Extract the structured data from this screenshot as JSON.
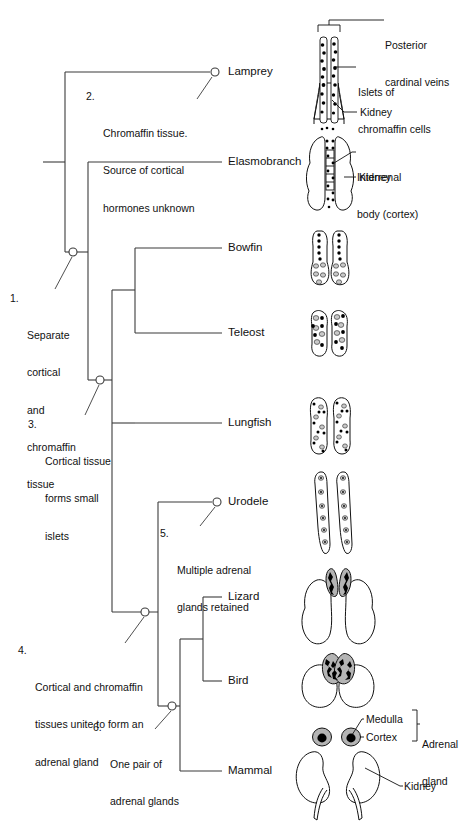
{
  "figure": {
    "kind": "cladogram",
    "line_color": "#3b3b3b",
    "ink_color": "#111111",
    "fill_white": "#ffffff",
    "fill_gray": "#b4b4b4",
    "fill_black": "#000000"
  },
  "taxa": [
    {
      "id": "lamprey",
      "label": "Lamprey",
      "x": 228,
      "y": 72,
      "node": true
    },
    {
      "id": "elasmobranch",
      "label": "Elasmobranch",
      "x": 228,
      "y": 162,
      "node": false
    },
    {
      "id": "bowfin",
      "label": "Bowfin",
      "x": 228,
      "y": 248,
      "node": false
    },
    {
      "id": "teleost",
      "label": "Teleost",
      "x": 228,
      "y": 333,
      "node": false
    },
    {
      "id": "lungfish",
      "label": "Lungfish",
      "x": 228,
      "y": 423,
      "node": false
    },
    {
      "id": "urodele",
      "label": "Urodele",
      "x": 228,
      "y": 502,
      "node": true
    },
    {
      "id": "lizard",
      "label": "Lizard",
      "x": 228,
      "y": 597,
      "node": false
    },
    {
      "id": "bird",
      "label": "Bird",
      "x": 228,
      "y": 681,
      "node": false
    },
    {
      "id": "mammal",
      "label": "Mammal",
      "x": 228,
      "y": 771,
      "node": false
    }
  ],
  "notes": [
    {
      "id": "note-2",
      "num": "2.",
      "lines": [
        "Chromaffin tissue.",
        "Source of cortical",
        "hormones unknown"
      ],
      "text": "2. Chromaffin tissue. Source of cortical hormones unknown",
      "x": 86,
      "y": 90,
      "leader": {
        "x1": 212,
        "y1": 78,
        "x2": 196,
        "y2": 100
      }
    },
    {
      "id": "note-1",
      "num": "1.",
      "lines": [
        "Separate",
        "cortical",
        "and",
        "chromaffin",
        "tissue"
      ],
      "text": "1. Separate cortical and chromaffin tissue",
      "x": 10,
      "y": 292,
      "leader": {
        "x1": 72,
        "y1": 258,
        "x2": 54,
        "y2": 288
      }
    },
    {
      "id": "note-3",
      "num": "3.",
      "lines": [
        "Cortical tissue",
        "forms small",
        "islets"
      ],
      "text": "3. Cortical tissue forms small islets",
      "x": 28,
      "y": 418,
      "leader": {
        "x1": 99,
        "y1": 386,
        "x2": 84,
        "y2": 414
      }
    },
    {
      "id": "note-5",
      "num": "5.",
      "lines": [
        "Multiple adrenal",
        "glands retained"
      ],
      "text": "5. Multiple adrenal glands retained",
      "x": 160,
      "y": 527,
      "leader": {
        "x1": 215,
        "y1": 508,
        "x2": 199,
        "y2": 525
      }
    },
    {
      "id": "note-4",
      "num": "4.",
      "lines": [
        "Cortical and chromaffin",
        "tissues unite to form an",
        "adrenal gland"
      ],
      "text": "4. Cortical and chromaffin tissues unite to form an adrenal gland",
      "x": 18,
      "y": 644,
      "leader": {
        "x1": 144,
        "y1": 618,
        "x2": 124,
        "y2": 642
      }
    },
    {
      "id": "note-6",
      "num": "6.",
      "lines": [
        "One pair of",
        "adrenal glands"
      ],
      "text": "6. One pair of adrenal glands",
      "x": 93,
      "y": 721,
      "leader": {
        "x1": 171,
        "y1": 712,
        "x2": 154,
        "y2": 728
      }
    }
  ],
  "annotations": [
    {
      "id": "anno-posterior-cardinal-veins",
      "lines": [
        "Posterior",
        "cardinal veins"
      ],
      "text": "Posterior cardinal veins",
      "x": 385,
      "y": 14
    },
    {
      "id": "anno-islets-chromaffin",
      "lines": [
        "Islets of",
        "chromaffin cells"
      ],
      "text": "Islets of chromaffin cells",
      "x": 358,
      "y": 64
    },
    {
      "id": "anno-kidney-lamprey",
      "lines": [
        "Kidney"
      ],
      "text": "Kidney",
      "x": 358,
      "y": 104
    },
    {
      "id": "anno-interrenal-body",
      "lines": [
        "Interrenal",
        "body (cortex)"
      ],
      "text": "Interrenal body (cortex)",
      "x": 357,
      "y": 146
    },
    {
      "id": "anno-kidney-elasmobranch",
      "lines": [
        "Kidney"
      ],
      "text": "Kidney",
      "x": 357,
      "y": 180
    },
    {
      "id": "anno-medulla",
      "lines": [
        "Medulla"
      ],
      "text": "Medulla",
      "x": 366,
      "y": 714
    },
    {
      "id": "anno-cortex",
      "lines": [
        "Cortex"
      ],
      "text": "Cortex",
      "x": 366,
      "y": 731
    },
    {
      "id": "anno-adrenal-gland",
      "lines": [
        "Adrenal",
        "gland"
      ],
      "text": "Adrenal gland",
      "x": 420,
      "y": 714
    },
    {
      "id": "anno-kidney-mammal",
      "lines": [
        "Kidney"
      ],
      "text": "Kidney",
      "x": 404,
      "y": 782
    }
  ],
  "illustrations": [
    {
      "id": "illus-lamprey",
      "for": "lamprey",
      "caption": "Lamprey kidneys with paired posterior cardinal veins bearing islets of chromaffin cells"
    },
    {
      "id": "illus-elasmobranch",
      "for": "elasmobranch",
      "caption": "Elasmobranch kidneys with interrenal body (cortex) between them"
    },
    {
      "id": "illus-bowfin",
      "for": "bowfin",
      "caption": "Bowfin kidneys with chromaffin islets and cortical islets"
    },
    {
      "id": "illus-teleost",
      "for": "teleost",
      "caption": "Teleost kidneys with mixed cortical and chromaffin islets"
    },
    {
      "id": "illus-lungfish",
      "for": "lungfish",
      "caption": "Lungfish kidneys with many small islets"
    },
    {
      "id": "illus-urodele",
      "for": "urodele",
      "caption": "Urodele elongate kidneys with multiple adrenal glands retained"
    },
    {
      "id": "illus-lizard",
      "for": "lizard",
      "caption": "Lizard kidneys with paired discrete adrenal glands"
    },
    {
      "id": "illus-bird",
      "for": "bird",
      "caption": "Bird kidneys with paired adrenal glands of intermingled tissue"
    },
    {
      "id": "illus-mammal",
      "for": "mammal",
      "caption": "Mammal kidneys with one pair of adrenal glands, cortex surrounding medulla"
    }
  ]
}
